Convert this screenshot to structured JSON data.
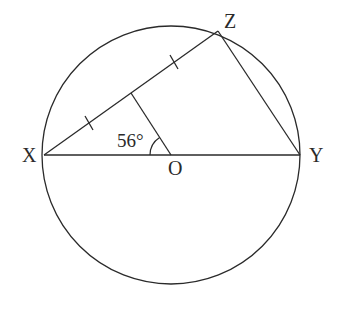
{
  "diagram": {
    "type": "circle-geometry",
    "stroke_color": "#2a2a2a",
    "background": "#ffffff",
    "circle": {
      "center_label": "O",
      "cx": 171,
      "cy": 155,
      "r": 129
    },
    "points": {
      "X": {
        "label": "X",
        "x": 44,
        "y": 155
      },
      "Y": {
        "label": "Y",
        "x": 300,
        "y": 155
      },
      "Z": {
        "label": "Z",
        "x": 218,
        "y": 31
      },
      "O": {
        "label": "O",
        "x": 171,
        "y": 155
      },
      "M": {
        "x": 131,
        "y": 93
      }
    },
    "segments": [
      "XY (diameter)",
      "XZ",
      "ZY",
      "MO"
    ],
    "equal_marks": "XM = MZ (single tick marks)",
    "angle": {
      "label": "56°",
      "at": "O",
      "between": [
        "OX",
        "OM"
      ]
    }
  }
}
